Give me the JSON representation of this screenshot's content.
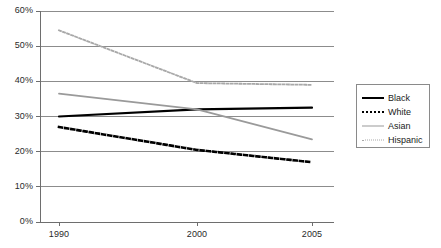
{
  "chart_data": {
    "type": "line",
    "title": "",
    "subtitle": "",
    "xlabel": "",
    "ylabel": "",
    "categories": [
      "1990",
      "2000",
      "2005"
    ],
    "x": [
      1990,
      2000,
      2005
    ],
    "xlim": [
      1990,
      2005
    ],
    "ylim": [
      0,
      60
    ],
    "ytick_labels": [
      "0%",
      "10%",
      "20%",
      "30%",
      "40%",
      "50%",
      "60%"
    ],
    "ytick_values": [
      0,
      10,
      20,
      30,
      40,
      50,
      60
    ],
    "xtick_labels": [
      "1990",
      "2000",
      "2005"
    ],
    "grid": "horizontal",
    "legend_position": "right",
    "value_suffix": "%",
    "series": [
      {
        "name": "Black",
        "values": [
          30.0,
          32.0,
          32.5
        ],
        "color": "#000000",
        "style": "solid",
        "width": 2.2
      },
      {
        "name": "White",
        "values": [
          27.0,
          20.5,
          17.0
        ],
        "color": "#000000",
        "style": "dotted",
        "width": 2.6
      },
      {
        "name": "Asian",
        "values": [
          36.5,
          32.0,
          23.5
        ],
        "color": "#9a9a9a",
        "style": "solid",
        "width": 1.8
      },
      {
        "name": "Hispanic",
        "values": [
          54.5,
          39.5,
          39.0
        ],
        "color": "#a8a8a8",
        "style": "dotted",
        "width": 1.8
      }
    ]
  },
  "axes": {
    "y_ticks": [
      {
        "label": "60%"
      },
      {
        "label": "50%"
      },
      {
        "label": "40%"
      },
      {
        "label": "30%"
      },
      {
        "label": "20%"
      },
      {
        "label": "10%"
      },
      {
        "label": "0%"
      }
    ],
    "x_ticks": [
      {
        "label": "1990"
      },
      {
        "label": "2000"
      },
      {
        "label": "2005"
      }
    ]
  },
  "legend": {
    "items": [
      {
        "label": "Black"
      },
      {
        "label": "White"
      },
      {
        "label": "Asian"
      },
      {
        "label": "Hispanic"
      }
    ]
  },
  "style": {
    "background": "#ffffff",
    "gridline_color": "#8c8c8c",
    "axis_color": "#6e6e6e",
    "text_color": "#1a1a1a",
    "legend_border": "#8a8a8a"
  }
}
